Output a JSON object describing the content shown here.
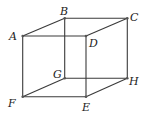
{
  "diagram": {
    "type": "cube",
    "vertices": [
      {
        "name": "A",
        "x": 22.7,
        "y": 36,
        "label_x": 9,
        "label_y": 40
      },
      {
        "name": "B",
        "x": 64.7,
        "y": 18.3,
        "label_x": 60,
        "label_y": 15
      },
      {
        "name": "C",
        "x": 127.3,
        "y": 18.3,
        "label_x": 130,
        "label_y": 21
      },
      {
        "name": "D",
        "x": 86,
        "y": 36,
        "label_x": 89,
        "label_y": 47
      },
      {
        "name": "G",
        "x": 64.7,
        "y": 78.3,
        "label_x": 53,
        "label_y": 78
      },
      {
        "name": "H",
        "x": 127.3,
        "y": 78.3,
        "label_x": 129,
        "label_y": 85
      },
      {
        "name": "F",
        "x": 22.7,
        "y": 96.7,
        "label_x": 8,
        "label_y": 107
      },
      {
        "name": "E",
        "x": 86,
        "y": 96.7,
        "label_x": 82,
        "label_y": 111
      }
    ],
    "edges": [
      [
        "A",
        "B"
      ],
      [
        "B",
        "C"
      ],
      [
        "C",
        "D"
      ],
      [
        "D",
        "A"
      ],
      [
        "F",
        "G"
      ],
      [
        "G",
        "H"
      ],
      [
        "H",
        "E"
      ],
      [
        "E",
        "F"
      ],
      [
        "A",
        "F"
      ],
      [
        "B",
        "G"
      ],
      [
        "C",
        "H"
      ],
      [
        "D",
        "E"
      ]
    ],
    "colors": {
      "edge": "#3a3a3a",
      "vertex": "#555555",
      "label": "#222222"
    }
  }
}
